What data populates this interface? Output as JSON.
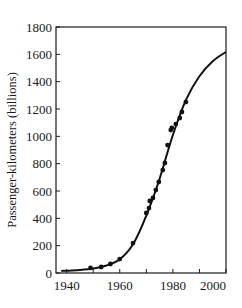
{
  "chart_data": {
    "type": "scatter",
    "title": "",
    "xlabel": "",
    "ylabel": "Passenger-kilometers (billions)",
    "xlim": [
      1936,
      2000
    ],
    "ylim": [
      0,
      1800
    ],
    "grid": false,
    "legend": null,
    "x_ticks": [
      1940,
      1950,
      1960,
      1970,
      1980,
      1990,
      2000
    ],
    "x_tick_labels": [
      "1940",
      "",
      "1960",
      "",
      "1980",
      "",
      "2000"
    ],
    "y_ticks": [
      0,
      200,
      400,
      600,
      800,
      1000,
      1200,
      1400,
      1600,
      1800
    ],
    "y_tick_labels": [
      "0",
      "200",
      "400",
      "600",
      "800",
      "1000",
      "1200",
      "1400",
      "1600",
      "1800"
    ],
    "series": [
      {
        "name": "Observed",
        "kind": "scatter",
        "x": [
          1949,
          1953,
          1956.5,
          1960,
          1965,
          1970,
          1971,
          1971.3,
          1972.5,
          1973.6,
          1974.7,
          1976.2,
          1977,
          1978,
          1979.2,
          1979.6,
          1981.1,
          1982.6,
          1983.4,
          1984.9
        ],
        "y": [
          37,
          44,
          66,
          102,
          219,
          439,
          475,
          527,
          549,
          607,
          666,
          753,
          805,
          936,
          1046,
          1061,
          1090,
          1134,
          1178,
          1251
        ]
      },
      {
        "name": "Logistic fit",
        "kind": "line",
        "x": [
          1938,
          1940,
          1945,
          1950,
          1955,
          1960,
          1965,
          1970,
          1975,
          1980,
          1985,
          1990,
          1995,
          2000
        ],
        "y": [
          15,
          17,
          22,
          32,
          55,
          100,
          210,
          420,
          690,
          1010,
          1270,
          1440,
          1550,
          1617
        ]
      }
    ]
  }
}
